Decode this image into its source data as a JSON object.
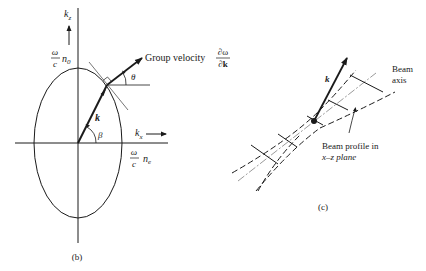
{
  "panel_b": {
    "caption": "(b)",
    "axis_kz": "k",
    "axis_kz_sub": "z",
    "axis_kx": "k",
    "axis_kx_sub": "x",
    "top_label_num": "ω",
    "top_label_den": "c",
    "top_label_n": "n",
    "top_label_sub": "0",
    "right_label_num": "ω",
    "right_label_den": "c",
    "right_label_n": "n",
    "right_label_sub": "e",
    "group_velocity_label": "Group velocity",
    "gv_num": "∂ω",
    "gv_den": "∂k",
    "vector_k": "k",
    "angle_beta": "β",
    "angle_theta": "θ"
  },
  "panel_c": {
    "caption": "(c)",
    "vector_k": "k",
    "beam_axis_line1": "Beam",
    "beam_axis_line2": "axis",
    "profile_line1": "Beam profile in",
    "profile_line2": "x–z plane"
  },
  "colors": {
    "ink": "#1a1a1a",
    "background": "#ffffff"
  }
}
